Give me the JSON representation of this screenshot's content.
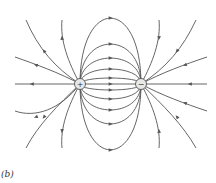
{
  "figure": {
    "caption": "(b)",
    "charges": [
      {
        "name": "positive-charge",
        "sign": "+"
      },
      {
        "name": "negative-charge",
        "sign": "−"
      }
    ],
    "line_color": "#555555"
  }
}
